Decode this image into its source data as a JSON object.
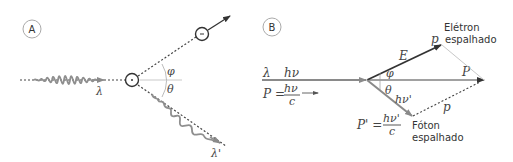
{
  "panels": {
    "a": {
      "label": "A",
      "incident_wavelength": "λ",
      "scattered_wavelength": "λ'",
      "angle_electron": "φ",
      "angle_photon": "θ",
      "electron_charge": "-"
    },
    "b": {
      "label": "B",
      "incident_wavelength": "λ",
      "incident_energy": "hν",
      "incident_momentum_lhs": "P =",
      "incident_momentum_num": "hν",
      "incident_momentum_den": "c",
      "electron_energy": "E",
      "electron_momentum": "p",
      "electron_title_line1": "Elétron",
      "electron_title_line2": "espalhado",
      "angle_electron": "φ",
      "angle_photon": "θ",
      "total_momentum": "P",
      "scattered_photon_energy": "hν'",
      "scattered_momentum_lhs": "P' =",
      "scattered_momentum_num": "hν'",
      "scattered_momentum_den": "c",
      "dashed_momentum": "p",
      "photon_title_line1": "Fóton",
      "photon_title_line2": "espalhado"
    }
  },
  "colors": {
    "dark_line": "#333333",
    "gray_line": "#8a8a8a",
    "light_line": "#c8c8c8",
    "wave": "#8f8f8f",
    "text": "#333333"
  }
}
